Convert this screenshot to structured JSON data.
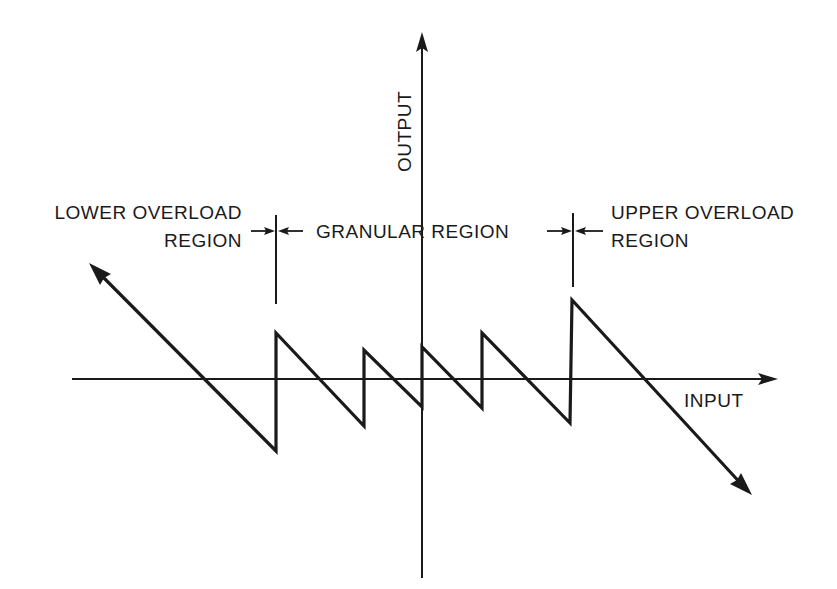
{
  "diagram": {
    "axes": {
      "x_label": "INPUT",
      "y_label": "OUTPUT"
    },
    "regions": {
      "lower": {
        "line1": "LOWER OVERLOAD",
        "line2": "REGION"
      },
      "granular": {
        "label": "GRANULAR REGION"
      },
      "upper": {
        "line1": "UPPER OVERLOAD",
        "line2": "REGION"
      }
    },
    "colors": {
      "stroke": "#1a1a1a",
      "background": "#ffffff"
    }
  }
}
